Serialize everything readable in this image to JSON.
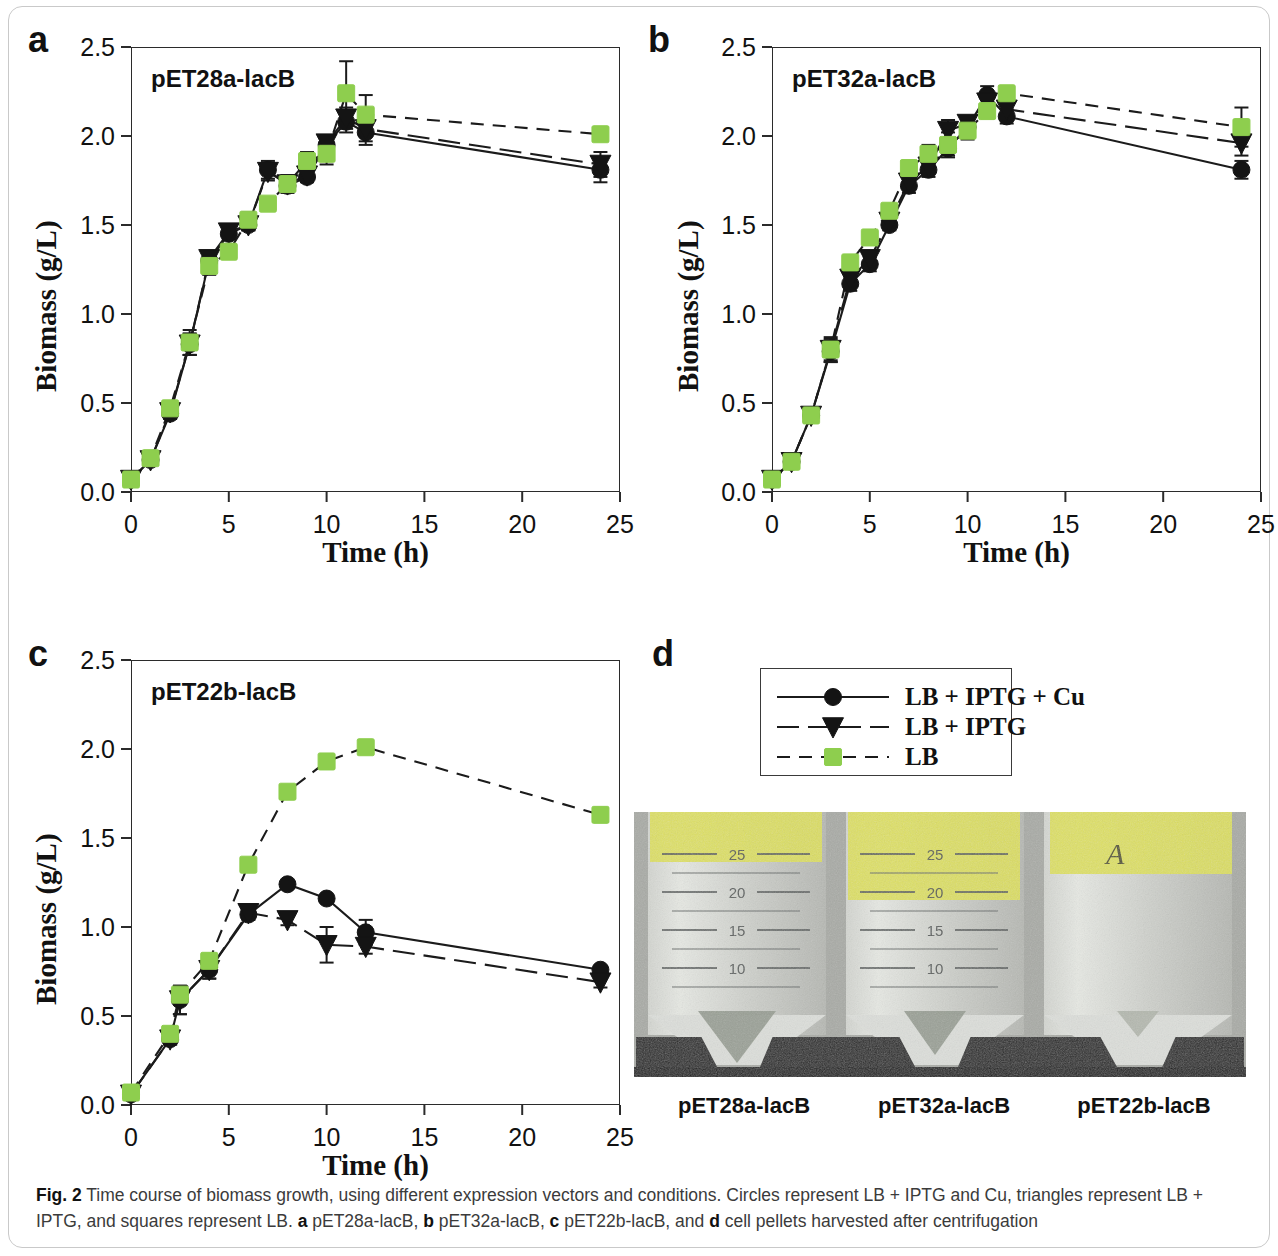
{
  "figure": {
    "label": "Fig. 2",
    "caption_text": " Time course of biomass growth, using different expression vectors and conditions. Circles represent LB + IPTG and Cu, triangles represent LB + IPTG, and squares represent LB. ",
    "caption_a_letter": "a",
    "caption_a_text": " pET28a-lacB, ",
    "caption_b_letter": "b",
    "caption_b_text": " pET32a-lacB, ",
    "caption_c_letter": "c",
    "caption_c_text": " pET22b-lacB, and ",
    "caption_d_letter": "d",
    "caption_d_text": " cell pellets harvested after centrifugation"
  },
  "colors": {
    "green_marker": "#8ece4e",
    "black_marker": "#141414",
    "axis": "#2b2b2b",
    "photo_tape": "#dde05a"
  },
  "panels": {
    "a": {
      "letter": "a"
    },
    "b": {
      "letter": "b"
    },
    "c": {
      "letter": "c"
    },
    "d": {
      "letter": "d"
    }
  },
  "legend": {
    "items": [
      {
        "label": "LB + IPTG + Cu",
        "marker": "circle",
        "line": "solid",
        "color": "#141414"
      },
      {
        "label": "LB + IPTG",
        "marker": "triangle-down",
        "line": "long-dash",
        "color": "#141414"
      },
      {
        "label": "LB",
        "marker": "square",
        "line": "dash",
        "color": "#8ece4e"
      }
    ]
  },
  "photo": {
    "tube_labels": [
      "pET28a-lacB",
      "pET32a-lacB",
      "pET22b-lacB"
    ],
    "graduation_marks": [
      "25",
      "20",
      "15",
      "10",
      "5"
    ],
    "handwriting": "A"
  },
  "chart_data": [
    {
      "id": "a",
      "type": "line",
      "title": "pET28a-lacB",
      "xlabel": "Time (h)",
      "ylabel": "Biomass (g/L)",
      "xlim": [
        0,
        25
      ],
      "ylim": [
        0,
        2.5
      ],
      "xticks": [
        0,
        5,
        10,
        15,
        20,
        25
      ],
      "yticks": [
        0.0,
        0.5,
        1.0,
        1.5,
        2.0,
        2.5
      ],
      "ytick_labels": [
        "0.0",
        "0.5",
        "1.0",
        "1.5",
        "2.0",
        "2.5"
      ],
      "grid": false,
      "series": [
        {
          "name": "LB + IPTG + Cu",
          "marker": "circle",
          "line": "solid",
          "color": "#141414",
          "x": [
            0,
            1,
            2,
            3,
            4,
            5,
            6,
            7,
            8,
            9,
            10,
            11,
            12,
            24
          ],
          "values": [
            0.07,
            0.18,
            0.44,
            0.83,
            1.3,
            1.45,
            1.5,
            1.81,
            1.72,
            1.77,
            1.95,
            2.08,
            2.02,
            1.81
          ],
          "err": [
            0.02,
            0.02,
            0.03,
            0.06,
            0.04,
            0.03,
            0.03,
            0.05,
            0.03,
            0.03,
            0.03,
            0.06,
            0.07,
            0.07
          ]
        },
        {
          "name": "LB + IPTG",
          "marker": "triangle-down",
          "line": "long-dash",
          "color": "#141414",
          "x": [
            0,
            1,
            2,
            3,
            4,
            5,
            6,
            7,
            8,
            9,
            10,
            11,
            12,
            24
          ],
          "values": [
            0.07,
            0.18,
            0.45,
            0.83,
            1.31,
            1.46,
            1.5,
            1.8,
            1.73,
            1.78,
            1.96,
            2.1,
            2.04,
            1.84
          ],
          "err": [
            0.02,
            0.02,
            0.03,
            0.06,
            0.04,
            0.03,
            0.03,
            0.05,
            0.03,
            0.03,
            0.03,
            0.06,
            0.07,
            0.07
          ]
        },
        {
          "name": "LB",
          "marker": "square",
          "line": "dash",
          "color": "#8ece4e",
          "x": [
            0,
            1,
            2,
            3,
            4,
            5,
            6,
            7,
            8,
            9,
            10,
            11,
            12,
            24
          ],
          "values": [
            0.07,
            0.19,
            0.47,
            0.84,
            1.27,
            1.35,
            1.53,
            1.62,
            1.73,
            1.86,
            1.9,
            2.24,
            2.12,
            2.01
          ],
          "err": [
            0.02,
            0.02,
            0.03,
            0.07,
            0.05,
            0.04,
            0.04,
            0.03,
            0.05,
            0.05,
            0.06,
            0.18,
            0.11,
            0.01
          ]
        }
      ]
    },
    {
      "id": "b",
      "type": "line",
      "title": "pET32a-lacB",
      "xlabel": "Time (h)",
      "ylabel": "Biomass (g/L)",
      "xlim": [
        0,
        25
      ],
      "ylim": [
        0,
        2.5
      ],
      "xticks": [
        0,
        5,
        10,
        15,
        20,
        25
      ],
      "yticks": [
        0.0,
        0.5,
        1.0,
        1.5,
        2.0,
        2.5
      ],
      "ytick_labels": [
        "0.0",
        "0.5",
        "1.0",
        "1.5",
        "2.0",
        "2.5"
      ],
      "grid": false,
      "series": [
        {
          "name": "LB + IPTG + Cu",
          "marker": "circle",
          "line": "solid",
          "color": "#141414",
          "x": [
            0,
            1,
            2,
            3,
            4,
            5,
            6,
            7,
            8,
            9,
            10,
            11,
            12,
            24
          ],
          "values": [
            0.07,
            0.17,
            0.43,
            0.79,
            1.17,
            1.28,
            1.5,
            1.72,
            1.81,
            1.93,
            2.05,
            2.23,
            2.11,
            1.81
          ],
          "err": [
            0.02,
            0.02,
            0.03,
            0.06,
            0.04,
            0.04,
            0.03,
            0.04,
            0.04,
            0.04,
            0.04,
            0.05,
            0.04,
            0.05
          ]
        },
        {
          "name": "LB + IPTG",
          "marker": "triangle-down",
          "line": "long-dash",
          "color": "#141414",
          "x": [
            0,
            1,
            2,
            3,
            4,
            5,
            6,
            7,
            8,
            9,
            10,
            11,
            12,
            24
          ],
          "values": [
            0.07,
            0.17,
            0.43,
            0.8,
            1.2,
            1.31,
            1.52,
            1.74,
            1.83,
            2.03,
            2.07,
            2.19,
            2.15,
            1.96
          ],
          "err": [
            0.02,
            0.02,
            0.03,
            0.06,
            0.04,
            0.04,
            0.03,
            0.04,
            0.04,
            0.06,
            0.04,
            0.05,
            0.04,
            0.07
          ]
        },
        {
          "name": "LB",
          "marker": "square",
          "line": "dash",
          "color": "#8ece4e",
          "x": [
            0,
            1,
            2,
            3,
            4,
            5,
            6,
            7,
            8,
            9,
            10,
            11,
            12,
            24
          ],
          "values": [
            0.07,
            0.17,
            0.43,
            0.8,
            1.29,
            1.43,
            1.58,
            1.82,
            1.9,
            1.95,
            2.03,
            2.14,
            2.24,
            2.05
          ],
          "err": [
            0.02,
            0.02,
            0.03,
            0.07,
            0.04,
            0.04,
            0.03,
            0.03,
            0.05,
            0.07,
            0.05,
            0.04,
            0.03,
            0.11
          ]
        }
      ]
    },
    {
      "id": "c",
      "type": "line",
      "title": "pET22b-lacB",
      "xlabel": "Time (h)",
      "ylabel": "Biomass (g/L)",
      "xlim": [
        0,
        25
      ],
      "ylim": [
        0,
        2.5
      ],
      "xticks": [
        0,
        5,
        10,
        15,
        20,
        25
      ],
      "yticks": [
        0.0,
        0.5,
        1.0,
        1.5,
        2.0,
        2.5
      ],
      "ytick_labels": [
        "0.0",
        "0.5",
        "1.0",
        "1.5",
        "2.0",
        "2.5"
      ],
      "grid": false,
      "series": [
        {
          "name": "LB + IPTG + Cu",
          "marker": "circle",
          "line": "solid",
          "color": "#141414",
          "x": [
            0,
            2,
            2.5,
            4,
            6,
            8,
            10,
            12,
            24
          ],
          "values": [
            0.06,
            0.37,
            0.59,
            0.76,
            1.07,
            1.24,
            1.16,
            0.97,
            0.76
          ],
          "err": [
            0.02,
            0.03,
            0.08,
            0.05,
            0.03,
            0.02,
            0.02,
            0.07,
            0.02
          ]
        },
        {
          "name": "LB + IPTG",
          "marker": "triangle-down",
          "line": "long-dash",
          "color": "#141414",
          "x": [
            0,
            2,
            2.5,
            4,
            6,
            8,
            10,
            12,
            24
          ],
          "values": [
            0.06,
            0.37,
            0.59,
            0.76,
            1.08,
            1.04,
            0.9,
            0.89,
            0.69
          ],
          "err": [
            0.02,
            0.03,
            0.08,
            0.05,
            0.03,
            0.03,
            0.1,
            0.04,
            0.03
          ]
        },
        {
          "name": "LB",
          "marker": "square",
          "line": "dash",
          "color": "#8ece4e",
          "x": [
            0,
            2,
            2.5,
            4,
            6,
            8,
            10,
            12,
            24
          ],
          "values": [
            0.07,
            0.4,
            0.62,
            0.81,
            1.35,
            1.76,
            1.93,
            2.01,
            1.63
          ],
          "err": [
            0.02,
            0.02,
            0.02,
            0.02,
            0.02,
            0.02,
            0.02,
            0.02,
            0.02
          ]
        }
      ]
    }
  ]
}
